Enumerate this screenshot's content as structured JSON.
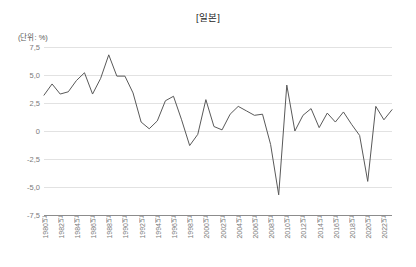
{
  "chart_data": {
    "type": "line",
    "title": "[일본]",
    "subtitle": "",
    "unit_label": "(단위: %)",
    "xlabel": "",
    "ylabel": "",
    "ylim": [
      -7.5,
      7.5
    ],
    "yticks": [
      "7,5",
      "5,0",
      "2,5",
      "0",
      "-2,5",
      "-5,0",
      "-7,5"
    ],
    "ytick_values": [
      7.5,
      5.0,
      2.5,
      0,
      -2.5,
      -5.0,
      -7.5
    ],
    "grid": true,
    "legend": "none",
    "line_color": "#595959",
    "grid_color": "#e2e2e2",
    "axis_color": "#8c8c8c",
    "xtick_labels": [
      "1980년",
      "1982년",
      "1984년",
      "1986년",
      "1988년",
      "1990년",
      "1992년",
      "1994년",
      "1996년",
      "1998년",
      "2000년",
      "2002년",
      "2004년",
      "2006년",
      "2008년",
      "2010년",
      "2012년",
      "2014년",
      "2016년",
      "2018년",
      "2020년",
      "2022년"
    ],
    "xtick_years": [
      1980,
      1982,
      1984,
      1986,
      1988,
      1990,
      1992,
      1994,
      1996,
      1998,
      2000,
      2002,
      2004,
      2006,
      2008,
      2010,
      2012,
      2014,
      2016,
      2018,
      2020,
      2022
    ],
    "x": [
      1980,
      1981,
      1982,
      1983,
      1984,
      1985,
      1986,
      1987,
      1988,
      1989,
      1990,
      1991,
      1992,
      1993,
      1994,
      1995,
      1996,
      1997,
      1998,
      1999,
      2000,
      2001,
      2002,
      2003,
      2004,
      2005,
      2006,
      2007,
      2008,
      2009,
      2010,
      2011,
      2012,
      2013,
      2014,
      2015,
      2016,
      2017,
      2018,
      2019,
      2020,
      2021,
      2022,
      2023
    ],
    "values": [
      3.2,
      4.2,
      3.3,
      3.5,
      4.5,
      5.2,
      3.3,
      4.7,
      6.8,
      4.9,
      4.9,
      3.4,
      0.8,
      0.2,
      0.9,
      2.7,
      3.1,
      1.0,
      -1.3,
      -0.3,
      2.8,
      0.4,
      0.1,
      1.5,
      2.2,
      1.8,
      1.4,
      1.5,
      -1.2,
      -5.7,
      4.1,
      0.0,
      1.4,
      2.0,
      0.3,
      1.6,
      0.8,
      1.7,
      0.6,
      -0.4,
      -4.5,
      2.2,
      1.0,
      1.9
    ]
  }
}
